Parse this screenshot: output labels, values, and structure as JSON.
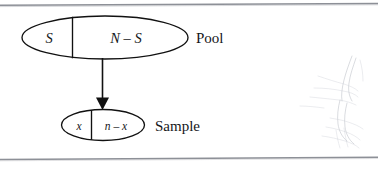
{
  "figure": {
    "background_color": "#ffffff",
    "ink_color": "#111111",
    "rule_color": "#8d9097"
  },
  "pool": {
    "label": "Pool",
    "left_cell": "S",
    "right_cell": "N – S"
  },
  "sample": {
    "label": "Sample",
    "left_cell": "x",
    "right_cell": "n – x"
  },
  "arrow": {
    "name": "sampling-arrow",
    "direction": "down"
  },
  "rules": {
    "top": "",
    "bottom": ""
  }
}
